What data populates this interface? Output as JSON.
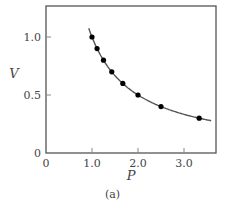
{
  "figure": {
    "caption": "(a)"
  },
  "chart_data": {
    "type": "scatter",
    "title": "",
    "xlabel": "P",
    "ylabel": "V",
    "xlim": [
      0,
      3.7
    ],
    "ylim": [
      0,
      1.2
    ],
    "x_ticks": [
      0,
      1.0,
      2.0,
      3.0
    ],
    "x_tick_labels": [
      "0",
      "1.0",
      "2.0",
      "3.0"
    ],
    "y_ticks": [
      0,
      0.5,
      1.0
    ],
    "y_tick_labels": [
      "0",
      "0.5",
      "1.0"
    ],
    "grid": false,
    "legend": null,
    "series": [
      {
        "name": "data points",
        "kind": "scatter",
        "x": [
          1.0,
          1.11,
          1.25,
          1.43,
          1.67,
          2.0,
          2.5,
          3.33
        ],
        "y": [
          1.0,
          0.9,
          0.8,
          0.7,
          0.6,
          0.5,
          0.4,
          0.3
        ],
        "color": "#000000"
      },
      {
        "name": "fit curve V = 1/P",
        "kind": "line",
        "x_range": [
          0.93,
          3.6
        ],
        "color": "#555555"
      }
    ]
  }
}
